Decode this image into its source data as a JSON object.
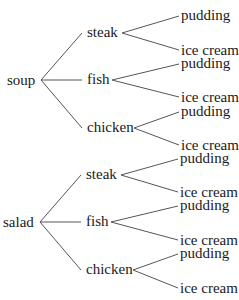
{
  "diagram": {
    "type": "tree",
    "line_color": "#555555",
    "text_color": "#1a1a1a",
    "roots": [
      {
        "label": "soup",
        "children": [
          {
            "label": "steak",
            "children": [
              {
                "label": "pudding"
              },
              {
                "label": "ice cream"
              }
            ]
          },
          {
            "label": "fish",
            "children": [
              {
                "label": "pudding"
              },
              {
                "label": "ice cream"
              }
            ]
          },
          {
            "label": "chicken",
            "children": [
              {
                "label": "pudding"
              },
              {
                "label": "ice cream"
              }
            ]
          }
        ]
      },
      {
        "label": "salad",
        "children": [
          {
            "label": "steak",
            "children": [
              {
                "label": "pudding"
              },
              {
                "label": "ice cream"
              }
            ]
          },
          {
            "label": "fish",
            "children": [
              {
                "label": "pudding"
              },
              {
                "label": "ice cream"
              }
            ]
          },
          {
            "label": "chicken",
            "children": [
              {
                "label": "pudding"
              },
              {
                "label": "ice cream"
              }
            ]
          }
        ]
      }
    ]
  }
}
